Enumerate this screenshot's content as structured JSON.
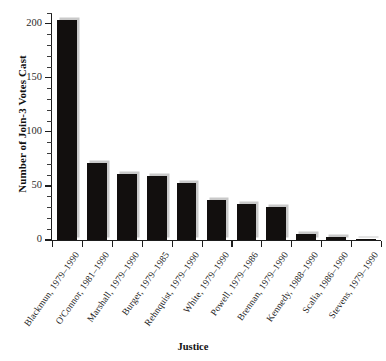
{
  "chart_data": {
    "type": "bar",
    "title": "",
    "xlabel": "Justice",
    "ylabel": "Number of Join-3 Votes Cast",
    "ylim": [
      0,
      210
    ],
    "yticks": [
      0,
      50,
      100,
      150,
      200
    ],
    "ytick_labels": [
      "0",
      "50",
      "100",
      "150",
      "200"
    ],
    "minor_tick_step": 10,
    "grid": false,
    "legend": null,
    "bar_color": "#120f0e",
    "bar_shadow_color": "#c9c9c9",
    "axis_color": "#1d1d1d",
    "categories": [
      "Blackmun, 1979–1990",
      "O'Connor, 1981–1990",
      "Marshall, 1979–1990",
      "Burger, 1979–1985",
      "Rehnquist, 1979–1990",
      "White, 1979–1990",
      "Powell, 1979–1986",
      "Brennan, 1979–1990",
      "Kennedy, 1988–1990",
      "Scalia, 1986–1990",
      "Stevens, 1979–1990"
    ],
    "values": [
      204,
      71,
      61,
      59,
      53,
      37,
      33,
      31,
      6,
      3,
      1
    ]
  }
}
